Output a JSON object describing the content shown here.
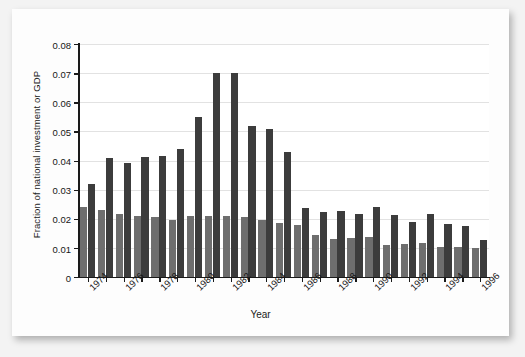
{
  "figure": {
    "ylabel": "Fraction of national investment or GDP",
    "xlabel": "Year"
  },
  "chart_data": {
    "type": "bar",
    "title": "",
    "xlabel": "Year",
    "ylabel": "Fraction of national investment or GDP",
    "ylim": [
      0,
      0.08
    ],
    "ytick_labels": [
      "0.08",
      "0.07",
      "0.06",
      "0.05",
      "0.04",
      "0.03",
      "0.02",
      "0.01",
      "0"
    ],
    "ytick_values": [
      0.08,
      0.07,
      0.06,
      0.05,
      0.04,
      0.03,
      0.02,
      0.01,
      0
    ],
    "grid": true,
    "legend": "none",
    "categories": [
      1974,
      1975,
      1976,
      1977,
      1978,
      1979,
      1980,
      1981,
      1982,
      1983,
      1984,
      1985,
      1986,
      1987,
      1988,
      1989,
      1990,
      1991,
      1992,
      1993,
      1994,
      1995,
      1996
    ],
    "xtick_labels": [
      "1974",
      "",
      "1976",
      "",
      "1978",
      "",
      "1980",
      "",
      "1982",
      "",
      "1984",
      "",
      "1986",
      "",
      "1988",
      "",
      "1990",
      "",
      "1992",
      "",
      "1994",
      "",
      "1996"
    ],
    "series": [
      {
        "name": "light-series",
        "color": "#6e6e6e",
        "values": [
          0.024,
          0.023,
          0.0215,
          0.021,
          0.0205,
          0.0196,
          0.021,
          0.021,
          0.0208,
          0.0205,
          0.0196,
          0.0185,
          0.0177,
          0.0144,
          0.0132,
          0.0135,
          0.0138,
          0.011,
          0.0115,
          0.0118,
          0.0103,
          0.0103,
          0.01
        ]
      },
      {
        "name": "dark-series",
        "color": "#3c3c3c",
        "values": [
          0.032,
          0.041,
          0.039,
          0.0412,
          0.0415,
          0.044,
          0.055,
          0.07,
          0.0702,
          0.052,
          0.0508,
          0.0428,
          0.0237,
          0.0223,
          0.0228,
          0.0218,
          0.024,
          0.0214,
          0.019,
          0.0215,
          0.0183,
          0.0175,
          0.0128
        ]
      }
    ]
  }
}
